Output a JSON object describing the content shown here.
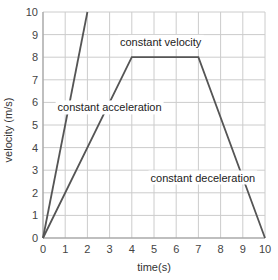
{
  "chart_data": {
    "type": "line",
    "title": "",
    "xlabel": "time(s)",
    "ylabel": "velocity (m/s)",
    "xlim": [
      0,
      10
    ],
    "ylim": [
      0,
      10
    ],
    "grid": true,
    "x_ticks": [
      "0",
      "1",
      "2",
      "3",
      "4",
      "5",
      "6",
      "7",
      "8",
      "9",
      "10"
    ],
    "y_ticks": [
      "0",
      "1",
      "2",
      "3",
      "4",
      "5",
      "6",
      "7",
      "8",
      "9",
      "10"
    ],
    "series": [
      {
        "name": "steep constant acceleration",
        "x": [
          0,
          2
        ],
        "y": [
          0,
          10
        ]
      },
      {
        "name": "motion profile",
        "x": [
          0,
          4,
          7,
          10
        ],
        "y": [
          0,
          8,
          8,
          0
        ]
      }
    ],
    "annotations": [
      {
        "text": "constant velocity",
        "x": 5.3,
        "y": 8.5
      },
      {
        "text": "constant acceleration",
        "x": 3.0,
        "y": 5.6
      },
      {
        "text": "constant deceleration",
        "x": 7.2,
        "y": 2.5
      }
    ],
    "line_color": "#555555",
    "grid_color": "#cccccc"
  }
}
